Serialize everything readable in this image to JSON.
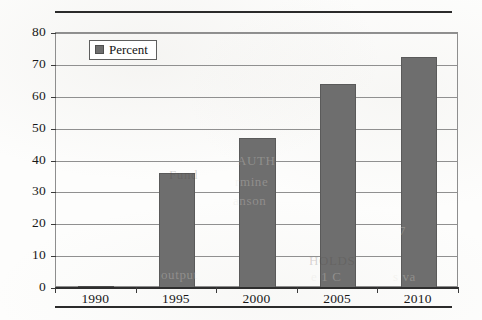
{
  "chart_data": {
    "type": "bar",
    "title": "",
    "xlabel": "",
    "ylabel": "",
    "categories": [
      "1990",
      "1995",
      "2000",
      "2005",
      "2010"
    ],
    "values": [
      0.5,
      36,
      47,
      64,
      72.5
    ],
    "series": [
      {
        "name": "Percent",
        "values": [
          0.5,
          36,
          47,
          64,
          72.5
        ]
      }
    ],
    "ylim": [
      0,
      80
    ],
    "ytick_step": 10,
    "ytick_labels": [
      "0",
      "10",
      "20",
      "30",
      "40",
      "50",
      "60",
      "70",
      "80"
    ],
    "grid": true,
    "legend_position": "top-left",
    "bar_color": "#6e6e6e",
    "bar_edge_color": "#5a5a5a",
    "axis_color": "#2e2e2e",
    "gridline_color": "#909090"
  },
  "legend": {
    "entries": [
      {
        "label": "Percent",
        "color": "#6e6e6e"
      }
    ]
  },
  "artifacts": {
    "description": "faint bleed-through text from reverse side of scanned page",
    "ghost_text": [
      {
        "text": "Fund",
        "x": 168,
        "y": 166
      },
      {
        "text": "output",
        "x": 160,
        "y": 266
      },
      {
        "text": "AUTH",
        "x": 236,
        "y": 152
      },
      {
        "text": "rmine",
        "x": 234,
        "y": 173
      },
      {
        "text": "anson",
        "x": 232,
        "y": 192
      },
      {
        "text": "HOLDS",
        "x": 308,
        "y": 252
      },
      {
        "text": "e 1 C",
        "x": 310,
        "y": 268
      },
      {
        "text": "s va",
        "x": 392,
        "y": 268
      },
      {
        "text": "7",
        "x": 398,
        "y": 222
      }
    ]
  }
}
